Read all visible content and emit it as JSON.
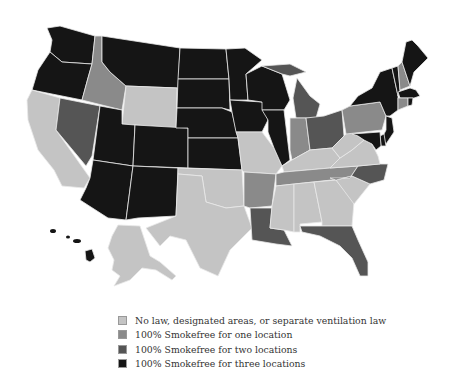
{
  "legend": {
    "items": [
      {
        "key": "none",
        "label": "No law, designated areas, or separate ventilation law",
        "color": "#c4c4c4"
      },
      {
        "key": "one",
        "label": "100% Smokefree for one location",
        "color": "#8a8a8a"
      },
      {
        "key": "two",
        "label": "100% Smokefree for two locations",
        "color": "#555555"
      },
      {
        "key": "three",
        "label": "100% Smokefree for three locations",
        "color": "#151515"
      }
    ]
  },
  "map": {
    "title": "US state smokefree laws",
    "states": {
      "WA": "three",
      "OR": "three",
      "CA": "none",
      "NV": "two",
      "ID": "one",
      "MT": "three",
      "WY": "none",
      "UT": "three",
      "AZ": "three",
      "CO": "three",
      "NM": "three",
      "ND": "three",
      "SD": "three",
      "NE": "three",
      "KS": "three",
      "OK": "none",
      "TX": "none",
      "MN": "three",
      "IA": "three",
      "MO": "none",
      "AR": "one",
      "LA": "two",
      "WI": "three",
      "IL": "three",
      "MI": "two",
      "IN": "one",
      "OH": "two",
      "KY": "none",
      "TN": "one",
      "MS": "none",
      "AL": "none",
      "GA": "none",
      "FL": "two",
      "SC": "none",
      "NC": "two",
      "VA": "none",
      "WV": "none",
      "PA": "one",
      "NY": "three",
      "VT": "three",
      "NH": "one",
      "ME": "three",
      "MA": "three",
      "CT": "one",
      "RI": "three",
      "NJ": "three",
      "DE": "three",
      "MD": "three",
      "AK": "none",
      "HI": "three"
    }
  }
}
